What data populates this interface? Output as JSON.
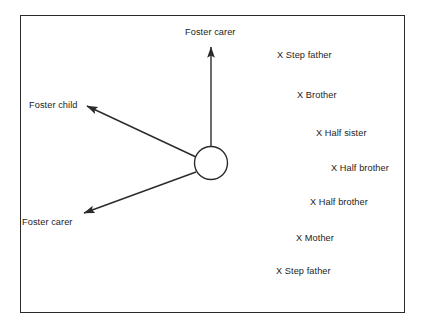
{
  "diagram": {
    "frame": {
      "border_color": "#2b2b2b",
      "background": "#ffffff"
    },
    "focal_node": {
      "shape": "circle",
      "cx": 211,
      "cy": 163,
      "r": 16.5,
      "stroke": "#2b2b2b"
    },
    "connections": [
      {
        "id": "foster-carer-top",
        "label": "Foster carer",
        "direction": "up",
        "label_x": 185,
        "label_y": 27,
        "x1": 211,
        "y1": 146.5,
        "x2": 211,
        "y2": 47
      },
      {
        "id": "foster-child-left",
        "label": "Foster child",
        "direction": "upper-left",
        "label_x": 29,
        "label_y": 100,
        "x1": 196,
        "y1": 157,
        "x2": 87,
        "y2": 106
      },
      {
        "id": "foster-carer-lower-left",
        "label": "Foster carer",
        "direction": "lower-left",
        "label_x": 22,
        "label_y": 217,
        "x1": 196,
        "y1": 172,
        "x2": 84,
        "y2": 213
      }
    ],
    "relatives": [
      {
        "label": "X Step father",
        "x": 277,
        "y": 50
      },
      {
        "label": "X Brother",
        "x": 297,
        "y": 90
      },
      {
        "label": "X Half sister",
        "x": 316,
        "y": 128
      },
      {
        "label": "X Half brother",
        "x": 331,
        "y": 163
      },
      {
        "label": "X Half brother",
        "x": 310,
        "y": 197
      },
      {
        "label": "X Mother",
        "x": 296,
        "y": 233
      },
      {
        "label": "X Step father",
        "x": 276,
        "y": 266
      }
    ]
  }
}
